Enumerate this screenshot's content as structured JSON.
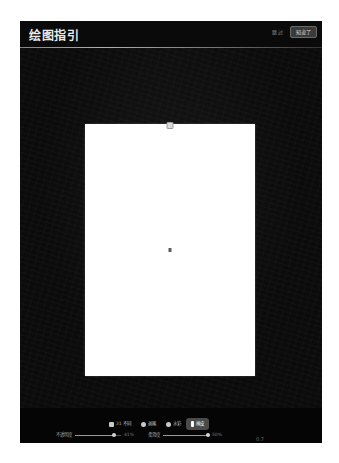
{
  "window": {
    "background": "#ffffff",
    "frame_background": "#060606"
  },
  "header": {
    "title": "绘图指引",
    "skip_label": "跳过",
    "next_label": "知道了",
    "divider_color": "#cfcfcf"
  },
  "workspace": {
    "canvas_background": "#ffffff",
    "backdrop_color": "#0b0b0b",
    "top_handle_name": "canvas-resize-handle",
    "center_marker_name": "canvas-center-marker"
  },
  "toolbar": {
    "tabs": [
      {
        "label": "21 不同",
        "icon": "square-icon",
        "icon_shape": "square",
        "active": false
      },
      {
        "label": "画笔",
        "icon": "dot-icon",
        "icon_shape": "dot",
        "active": false
      },
      {
        "label": "水彩",
        "icon": "dot-icon",
        "icon_shape": "dot",
        "active": false
      },
      {
        "label": "橡皮",
        "icon": "bar-icon",
        "icon_shape": "bar",
        "active": true
      }
    ],
    "active_tab_background": "#4a4a4a"
  },
  "sliders": [
    {
      "name": "opacity-slider",
      "label": "不透明度",
      "value": "41%",
      "percent": 84
    },
    {
      "name": "softness-slider",
      "label": "柔滑度",
      "value": "50%",
      "percent": 97
    }
  ],
  "readout": {
    "value": "0.7"
  }
}
